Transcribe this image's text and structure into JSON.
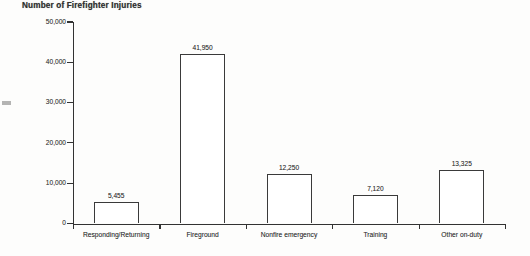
{
  "chart_data": {
    "type": "bar",
    "title": "Number of Firefighter Injuries",
    "xlabel": "",
    "ylabel": "",
    "categories": [
      "Responding/Returning",
      "Fireground",
      "Nonfire emergency",
      "Training",
      "Other on-duty"
    ],
    "values": [
      5455,
      41950,
      12250,
      7120,
      13325
    ],
    "value_labels": [
      "5,455",
      "41,950",
      "12,250",
      "7,120",
      "13,325"
    ],
    "ylim": [
      0,
      50000
    ],
    "yticks": [
      0,
      10000,
      20000,
      30000,
      40000,
      50000
    ],
    "ytick_labels": [
      "0",
      "10,000",
      "20,000",
      "30,000",
      "40,000",
      "50,000"
    ],
    "grid": false,
    "legend": false,
    "bar_fill": "#ffffff",
    "bar_edge_color": "#373737",
    "axis_color": "#2e2e2e",
    "text_color": "#333333",
    "background": "#fdfdfc"
  }
}
